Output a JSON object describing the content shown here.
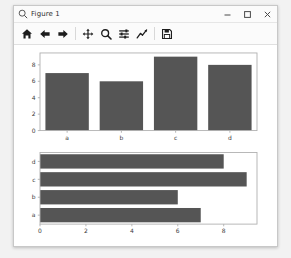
{
  "window": {
    "title": "Figure 1",
    "icon": "matplotlib-figure-icon",
    "minimize_label": "Minimize",
    "maximize_label": "Maximize",
    "close_label": "Close"
  },
  "toolbar": {
    "buttons": [
      {
        "name": "home-icon",
        "label": "Reset original view"
      },
      {
        "name": "arrow-left-icon",
        "label": "Back to previous view"
      },
      {
        "name": "arrow-right-icon",
        "label": "Forward to next view"
      },
      {
        "name": "move-icon",
        "label": "Pan axes with left mouse, zoom with right"
      },
      {
        "name": "magnifier-icon",
        "label": "Zoom to rectangle"
      },
      {
        "name": "sliders-icon",
        "label": "Configure subplots"
      },
      {
        "name": "line-chart-icon",
        "label": "Edit axis, curve and image parameters"
      },
      {
        "name": "floppy-disk-icon",
        "label": "Save the figure"
      }
    ]
  },
  "chart_data": [
    {
      "type": "bar",
      "orientation": "vertical",
      "title": "",
      "xlabel": "",
      "ylabel": "",
      "categories": [
        "a",
        "b",
        "c",
        "d"
      ],
      "values": [
        7,
        6,
        9,
        8
      ],
      "xticks": [
        "a",
        "b",
        "c",
        "d"
      ],
      "yticks": [
        0,
        2,
        4,
        6,
        8
      ],
      "ylim": [
        0,
        9.45
      ],
      "grid": false,
      "legend": null,
      "bar_color": "#555555"
    },
    {
      "type": "bar",
      "orientation": "horizontal",
      "title": "",
      "xlabel": "",
      "ylabel": "",
      "categories": [
        "a",
        "b",
        "c",
        "d"
      ],
      "values": [
        7,
        6,
        9,
        8
      ],
      "yticks": [
        "d",
        "c",
        "b",
        "a"
      ],
      "xticks": [
        0,
        2,
        4,
        6,
        8
      ],
      "xlim": [
        0,
        9.45
      ],
      "grid": false,
      "legend": null,
      "bar_color": "#555555"
    }
  ],
  "colors": {
    "bar": "#555555",
    "axes_spine": "#b0b0b0",
    "tick_text": "#3a3a3a",
    "canvas_bg": "#ffffff",
    "window_bg": "#fbfbfb",
    "desktop_bg": "#f2f2f2"
  }
}
